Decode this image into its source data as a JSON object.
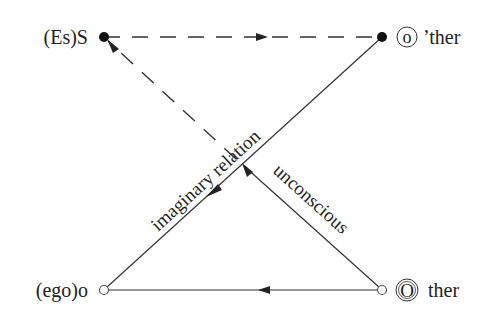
{
  "diagram": {
    "nodes": {
      "es_s": {
        "label": "(Es)S",
        "type": "filled"
      },
      "o_ther": {
        "circled": "o",
        "label": "’ther",
        "type": "filled"
      },
      "ego_o": {
        "label": "(ego)o",
        "type": "open"
      },
      "other": {
        "circled": "O",
        "label": "ther",
        "type": "open"
      }
    },
    "edges": {
      "imaginary": {
        "label": "imaginary relation",
        "from": "o'ther",
        "to": "(ego)o",
        "style": "solid"
      },
      "unconscious": {
        "label": "unconscious",
        "from": "Other",
        "to": "(Es)S",
        "style": "solid-then-dashed"
      },
      "top": {
        "from": "(Es)S",
        "to": "o'ther",
        "style": "dashed"
      },
      "bottom": {
        "from": "Other",
        "to": "(ego)o",
        "style": "solid"
      }
    },
    "colors": {
      "line": "#333333",
      "text": "#222222",
      "background": "#ffffff"
    }
  }
}
